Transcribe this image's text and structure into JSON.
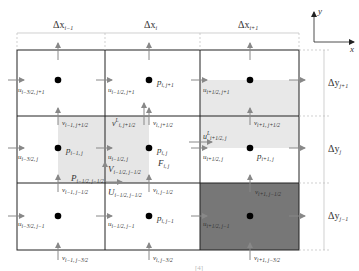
{
  "diagram": {
    "axes": {
      "x_label": "x",
      "y_label": "y"
    },
    "column_widths": [
      {
        "base": "Δx",
        "sub": "i−1"
      },
      {
        "base": "Δx",
        "sub": "i"
      },
      {
        "base": "Δx",
        "sub": "i+1"
      }
    ],
    "row_heights": [
      {
        "base": "Δy",
        "sub": "j+1"
      },
      {
        "base": "Δy",
        "sub": "j"
      },
      {
        "base": "Δy",
        "sub": "j−1"
      }
    ],
    "pressure_labels": [
      {
        "base": "p",
        "sub": "i, j+1"
      },
      {
        "base": "p",
        "sub": "i−1, j"
      },
      {
        "base": "p",
        "sub": "i, j"
      },
      {
        "base": "p",
        "sub": "i+1, j"
      },
      {
        "base": "p",
        "sub": "i, j−1"
      }
    ],
    "u_labels": [
      {
        "base": "u",
        "sub": "i−3/2, j+1"
      },
      {
        "base": "u",
        "sub": "i−1/2, j+1"
      },
      {
        "base": "u",
        "sub": "i+1/2, j+1"
      },
      {
        "base": "u",
        "sub": "i−3/2, j"
      },
      {
        "base": "u",
        "sub": "i−1/2, j"
      },
      {
        "base": "u",
        "sub": "i+1/2, j"
      },
      {
        "base": "u",
        "sub": "i−3/2, j−1"
      },
      {
        "base": "u",
        "sub": "i−1/2, j−1"
      },
      {
        "base": "u",
        "sub": "i+1/2, j−1"
      }
    ],
    "v_labels": [
      {
        "base": "v",
        "sub": "i−1, j+1/2"
      },
      {
        "base": "v",
        "sub": "i, j+1/2"
      },
      {
        "base": "v",
        "sub": "i+1, j+1/2"
      },
      {
        "base": "v",
        "sub": "i−1, j−1/2"
      },
      {
        "base": "v",
        "sub": "i, j−1/2"
      },
      {
        "base": "v",
        "sub": "i+1, j−1/2"
      },
      {
        "base": "v",
        "sub": "i−1, j−3/2"
      },
      {
        "base": "v",
        "sub": "i, j−3/2"
      },
      {
        "base": "v",
        "sub": "i+1, j−3/2"
      }
    ],
    "special_labels": {
      "vL": {
        "base": "v",
        "sup": "L",
        "sub": "i, j+1/2"
      },
      "uL": {
        "base": "u",
        "sup": "L",
        "sub": "i+1/2, j"
      },
      "F": {
        "base": "F",
        "sub": "i, j"
      },
      "V": {
        "base": "V",
        "sub": "i−1/2, j−1/2"
      },
      "P": {
        "base": "P",
        "sub": "i−1/2, j−1/2"
      },
      "U": {
        "base": "U",
        "sub": "i−1/2, j−1/2"
      }
    },
    "caption_fragment": "[4]",
    "colors": {
      "grid_line": "#222222",
      "arrow": "#888888",
      "light_shade": "#e8e8e8",
      "dark_shade": "#777777",
      "dot": "#000000",
      "dim_line": "#bbbbbb"
    }
  }
}
